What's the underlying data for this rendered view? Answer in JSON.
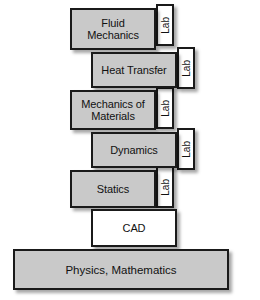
{
  "diagram": {
    "colors": {
      "block_fill": "#c9c9c9",
      "lab_fill": "#ffffff",
      "border": "#1a1a1a",
      "background": "#ffffff",
      "text": "#111111"
    },
    "courses": [
      {
        "id": "fluid-mechanics",
        "label": "Fluid\nMechanics",
        "lab_label": "Lab",
        "has_lab": true,
        "fill": "gray",
        "x": 70,
        "y": 8,
        "w": 86,
        "h": 42,
        "lab_x": 156,
        "lab_y": 4,
        "lab_w": 18,
        "lab_h": 42
      },
      {
        "id": "heat-transfer",
        "label": "Heat Transfer",
        "lab_label": "Lab",
        "has_lab": true,
        "fill": "gray",
        "x": 91,
        "y": 52,
        "w": 86,
        "h": 36,
        "lab_x": 177,
        "lab_y": 47,
        "lab_w": 18,
        "lab_h": 42
      },
      {
        "id": "mechanics-of-materials",
        "label": "Mechanics of\nMaterials",
        "lab_label": "Lab",
        "has_lab": true,
        "fill": "gray",
        "x": 70,
        "y": 90,
        "w": 86,
        "h": 40,
        "lab_x": 156,
        "lab_y": 87,
        "lab_w": 18,
        "lab_h": 42
      },
      {
        "id": "dynamics",
        "label": "Dynamics",
        "lab_label": "Lab",
        "has_lab": true,
        "fill": "gray",
        "x": 91,
        "y": 132,
        "w": 86,
        "h": 36,
        "lab_x": 177,
        "lab_y": 128,
        "lab_w": 18,
        "lab_h": 42
      },
      {
        "id": "statics",
        "label": "Statics",
        "lab_label": "Lab",
        "has_lab": true,
        "fill": "gray",
        "x": 70,
        "y": 170,
        "w": 86,
        "h": 38,
        "lab_x": 156,
        "lab_y": 166,
        "lab_w": 18,
        "lab_h": 42
      },
      {
        "id": "cad",
        "label": "CAD",
        "lab_label": "",
        "has_lab": false,
        "fill": "white",
        "x": 91,
        "y": 209,
        "w": 86,
        "h": 38,
        "lab_x": 0,
        "lab_y": 0,
        "lab_w": 0,
        "lab_h": 0
      }
    ],
    "foundation": {
      "id": "physics-mathematics",
      "label": "Physics, Mathematics",
      "x": 13,
      "y": 249,
      "w": 216,
      "h": 41
    }
  }
}
